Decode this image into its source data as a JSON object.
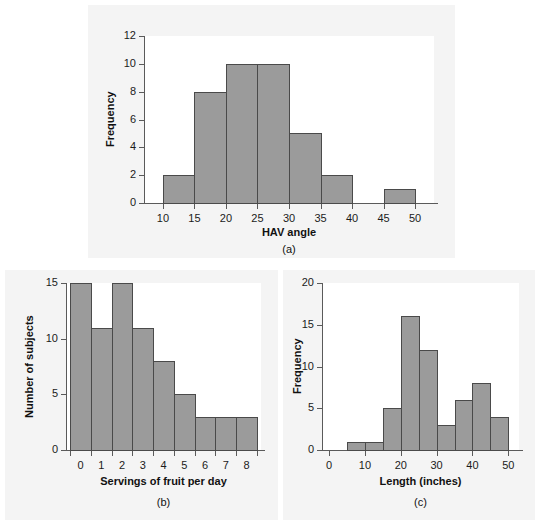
{
  "figure": {
    "background_color": "#ffffff",
    "panel_background_color": "#f4f4f4",
    "plot_background_color": "#ffffff",
    "bar_fill_color": "#9b9b9b",
    "bar_edge_color": "#4a4a4a",
    "axis_color": "#5a5a5a"
  },
  "captions": {
    "a": "(a)",
    "b": "(b)",
    "c": "(c)"
  },
  "chart_data": [
    {
      "id": "a",
      "type": "bar",
      "title": "",
      "subtitle": "",
      "xlabel": "HAV angle",
      "ylabel": "Frequency",
      "caption": "(a)",
      "bin_width": 5,
      "bin_edges": [
        10,
        15,
        20,
        25,
        30,
        35,
        40,
        45,
        50
      ],
      "categories": [
        "10-15",
        "15-20",
        "20-25",
        "25-30",
        "30-35",
        "35-40",
        "40-45",
        "45-50"
      ],
      "values": [
        2,
        8,
        10,
        10,
        5,
        2,
        0,
        1
      ],
      "xticks": [
        10,
        15,
        20,
        25,
        30,
        35,
        40,
        45,
        50
      ],
      "xtick_labels": [
        "10",
        "15",
        "20",
        "25",
        "30",
        "35",
        "40",
        "45",
        "50"
      ],
      "yticks": [
        0,
        2,
        4,
        6,
        8,
        10,
        12
      ],
      "ytick_labels": [
        "0",
        "2",
        "4",
        "6",
        "8",
        "10",
        "12"
      ],
      "xlim": [
        7,
        53
      ],
      "ylim": [
        0,
        12
      ],
      "grid": false,
      "legend": false
    },
    {
      "id": "b",
      "type": "bar",
      "title": "",
      "subtitle": "",
      "xlabel": "Servings of fruit per day",
      "ylabel": "Number of subjects",
      "caption": "(b)",
      "bin_width": 1,
      "bin_edges": [
        -0.5,
        0.5,
        1.5,
        2.5,
        3.5,
        4.5,
        5.5,
        6.5,
        7.5,
        8.5
      ],
      "categories": [
        "0",
        "1",
        "2",
        "3",
        "4",
        "5",
        "6",
        "7",
        "8"
      ],
      "values": [
        15,
        11,
        15,
        11,
        8,
        5,
        3,
        3,
        3
      ],
      "xticks": [
        -0.5,
        0.5,
        1.5,
        2.5,
        3.5,
        4.5,
        5.5,
        6.5,
        7.5,
        8.5
      ],
      "xtick_labels": [
        "0",
        "1",
        "2",
        "3",
        "4",
        "5",
        "6",
        "7",
        "8"
      ],
      "yticks": [
        0,
        5,
        10,
        15
      ],
      "ytick_labels": [
        "0",
        "5",
        "10",
        "15"
      ],
      "xlim": [
        -0.7,
        8.7
      ],
      "ylim": [
        0,
        15
      ],
      "grid": false,
      "legend": false
    },
    {
      "id": "c",
      "type": "bar",
      "title": "",
      "subtitle": "",
      "xlabel": "Length (inches)",
      "ylabel": "Frequency",
      "caption": "(c)",
      "bin_width": 5,
      "bin_edges": [
        5,
        10,
        15,
        20,
        25,
        30,
        35,
        40,
        45,
        50
      ],
      "categories": [
        "5-10",
        "10-15",
        "15-20",
        "20-25",
        "25-30",
        "30-35",
        "35-40",
        "40-45",
        "45-50"
      ],
      "values": [
        1,
        1,
        5,
        16,
        12,
        3,
        6,
        8,
        4
      ],
      "xticks": [
        0,
        10,
        20,
        30,
        40,
        50
      ],
      "xtick_labels": [
        "0",
        "10",
        "20",
        "30",
        "40",
        "50"
      ],
      "yticks": [
        0,
        5,
        10,
        15,
        20
      ],
      "ytick_labels": [
        "0",
        "5",
        "10",
        "15",
        "20"
      ],
      "xlim": [
        -2,
        53
      ],
      "ylim": [
        0,
        20
      ],
      "grid": false,
      "legend": false
    }
  ]
}
